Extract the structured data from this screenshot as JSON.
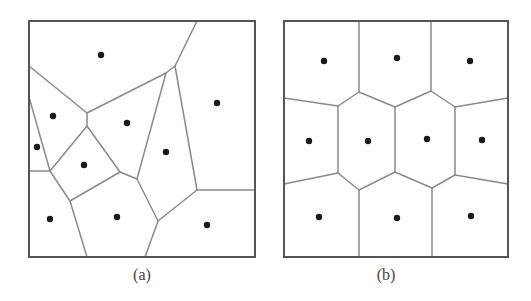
{
  "colors": {
    "border": "#555555",
    "edge": "#8a8a8a",
    "site": "#1a1a1a",
    "caption": "#444444"
  },
  "panels": [
    {
      "id": "a",
      "caption": "(a)",
      "description": "Irregular Voronoi diagram",
      "box": {
        "x1": 29,
        "y1": 21,
        "x2": 255,
        "y2": 257
      },
      "edges": [
        [
          [
            197,
            21
          ],
          [
            175,
            66
          ]
        ],
        [
          [
            175,
            66
          ],
          [
            166,
            73
          ]
        ],
        [
          [
            166,
            73
          ],
          [
            87,
            113
          ]
        ],
        [
          [
            29,
            66
          ],
          [
            87,
            113
          ]
        ],
        [
          [
            87,
            113
          ],
          [
            87,
            126
          ]
        ],
        [
          [
            29,
            97
          ],
          [
            50,
            171
          ]
        ],
        [
          [
            29,
            171
          ],
          [
            50,
            171
          ]
        ],
        [
          [
            87,
            126
          ],
          [
            50,
            171
          ]
        ],
        [
          [
            87,
            126
          ],
          [
            120,
            172
          ]
        ],
        [
          [
            50,
            171
          ],
          [
            70,
            201
          ]
        ],
        [
          [
            70,
            201
          ],
          [
            120,
            172
          ]
        ],
        [
          [
            120,
            172
          ],
          [
            137,
            179
          ]
        ],
        [
          [
            166,
            73
          ],
          [
            137,
            179
          ]
        ],
        [
          [
            175,
            66
          ],
          [
            197,
            190
          ]
        ],
        [
          [
            137,
            179
          ],
          [
            158,
            221
          ]
        ],
        [
          [
            197,
            190
          ],
          [
            158,
            221
          ]
        ],
        [
          [
            197,
            190
          ],
          [
            255,
            190
          ]
        ],
        [
          [
            70,
            201
          ],
          [
            87,
            257
          ]
        ],
        [
          [
            158,
            221
          ],
          [
            145,
            257
          ]
        ]
      ],
      "sites": [
        [
          101,
          55
        ],
        [
          53,
          116
        ],
        [
          127,
          123
        ],
        [
          217,
          103
        ],
        [
          37,
          147
        ],
        [
          84,
          165
        ],
        [
          166,
          152
        ],
        [
          50,
          219
        ],
        [
          117,
          217
        ],
        [
          207,
          225
        ]
      ]
    },
    {
      "id": "b",
      "caption": "(b)",
      "description": "Centroidal (regular) Voronoi diagram",
      "box": {
        "x1": 284,
        "y1": 21,
        "x2": 508,
        "y2": 257
      },
      "edges": [
        [
          [
            359,
            21
          ],
          [
            359,
            92
          ]
        ],
        [
          [
            431,
            21
          ],
          [
            431,
            91
          ]
        ],
        [
          [
            284,
            98
          ],
          [
            338,
            106
          ]
        ],
        [
          [
            338,
            106
          ],
          [
            359,
            92
          ]
        ],
        [
          [
            359,
            92
          ],
          [
            395,
            107
          ]
        ],
        [
          [
            395,
            107
          ],
          [
            431,
            91
          ]
        ],
        [
          [
            431,
            91
          ],
          [
            455,
            107
          ]
        ],
        [
          [
            455,
            107
          ],
          [
            508,
            98
          ]
        ],
        [
          [
            338,
            106
          ],
          [
            338,
            173
          ]
        ],
        [
          [
            395,
            107
          ],
          [
            395,
            172
          ]
        ],
        [
          [
            455,
            107
          ],
          [
            455,
            175
          ]
        ],
        [
          [
            284,
            184
          ],
          [
            338,
            173
          ]
        ],
        [
          [
            338,
            173
          ],
          [
            359,
            190
          ]
        ],
        [
          [
            359,
            190
          ],
          [
            395,
            172
          ]
        ],
        [
          [
            395,
            172
          ],
          [
            432,
            188
          ]
        ],
        [
          [
            432,
            188
          ],
          [
            455,
            175
          ]
        ],
        [
          [
            455,
            175
          ],
          [
            508,
            184
          ]
        ],
        [
          [
            359,
            190
          ],
          [
            359,
            257
          ]
        ],
        [
          [
            432,
            188
          ],
          [
            432,
            257
          ]
        ]
      ],
      "sites": [
        [
          324,
          61
        ],
        [
          397,
          58
        ],
        [
          470,
          61
        ],
        [
          309,
          141
        ],
        [
          368,
          141
        ],
        [
          427,
          139
        ],
        [
          482,
          140
        ],
        [
          319,
          217
        ],
        [
          397,
          218
        ],
        [
          471,
          216
        ]
      ]
    }
  ]
}
